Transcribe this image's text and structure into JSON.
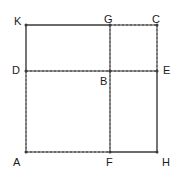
{
  "figure": {
    "canvas": {
      "width": 182,
      "height": 178
    },
    "stroke_color": "#3a3a3a",
    "label_color": "#1a1a1a",
    "stroke_width": 1.4,
    "dash_pattern": "2,2",
    "points": {
      "K": {
        "label": "K",
        "x": 26,
        "y": 25
      },
      "G": {
        "label": "G",
        "x": 110,
        "y": 25
      },
      "C": {
        "label": "C",
        "x": 157,
        "y": 25
      },
      "D": {
        "label": "D",
        "x": 26,
        "y": 71
      },
      "B": {
        "label": "B",
        "x": 110,
        "y": 71
      },
      "E": {
        "label": "E",
        "x": 157,
        "y": 71
      },
      "A": {
        "label": "A",
        "x": 26,
        "y": 152
      },
      "F": {
        "label": "F",
        "x": 110,
        "y": 152
      },
      "H": {
        "label": "H",
        "x": 157,
        "y": 152
      }
    },
    "labels": [
      {
        "name": "vertex-label-k",
        "text": "K",
        "x": 14,
        "y": 16
      },
      {
        "name": "vertex-label-g",
        "text": "G",
        "x": 104,
        "y": 14
      },
      {
        "name": "vertex-label-c",
        "text": "C",
        "x": 152,
        "y": 14
      },
      {
        "name": "vertex-label-d",
        "text": "D",
        "x": 12,
        "y": 65
      },
      {
        "name": "vertex-label-b",
        "text": "B",
        "x": 100,
        "y": 76
      },
      {
        "name": "vertex-label-e",
        "text": "E",
        "x": 163,
        "y": 65
      },
      {
        "name": "vertex-label-a",
        "text": "A",
        "x": 13,
        "y": 157
      },
      {
        "name": "vertex-label-f",
        "text": "F",
        "x": 106,
        "y": 157
      },
      {
        "name": "vertex-label-h",
        "text": "H",
        "x": 162,
        "y": 157
      }
    ],
    "segments": [
      {
        "name": "segment-k-g",
        "from": "K",
        "to": "G",
        "style": "solid"
      },
      {
        "name": "segment-k-d",
        "from": "K",
        "to": "D",
        "style": "solid"
      },
      {
        "name": "segment-g-c",
        "from": "G",
        "to": "C",
        "style": "dashed"
      },
      {
        "name": "segment-c-e",
        "from": "C",
        "to": "E",
        "style": "dashed"
      },
      {
        "name": "segment-d-b",
        "from": "D",
        "to": "B",
        "style": "dashed"
      },
      {
        "name": "segment-b-e",
        "from": "B",
        "to": "E",
        "style": "dashed"
      },
      {
        "name": "segment-g-b",
        "from": "G",
        "to": "B",
        "style": "dashed"
      },
      {
        "name": "segment-b-f",
        "from": "B",
        "to": "F",
        "style": "dashed"
      },
      {
        "name": "segment-d-a",
        "from": "D",
        "to": "A",
        "style": "dashed"
      },
      {
        "name": "segment-a-f",
        "from": "A",
        "to": "F",
        "style": "dashed"
      },
      {
        "name": "segment-f-h",
        "from": "F",
        "to": "H",
        "style": "solid"
      },
      {
        "name": "segment-e-h",
        "from": "E",
        "to": "H",
        "style": "solid"
      }
    ],
    "vertex_dots": [
      "K",
      "G",
      "C",
      "D",
      "B",
      "E",
      "A",
      "F",
      "H"
    ]
  }
}
